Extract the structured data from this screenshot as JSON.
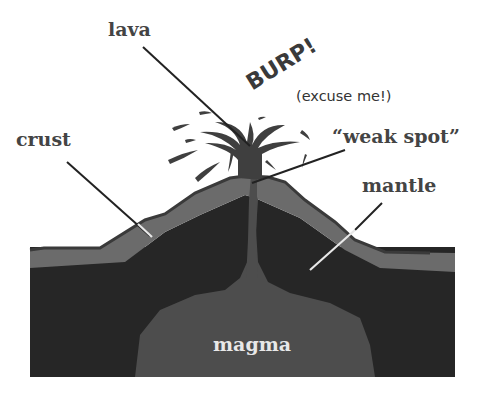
{
  "diagram": {
    "labels": {
      "lava": "lava",
      "burp": "BURP!",
      "excuse": "(excuse me!)",
      "crust": "crust",
      "weak_spot": "“weak spot”",
      "mantle": "mantle",
      "magma": "magma"
    },
    "colors": {
      "crust": "#6b6b6b",
      "mantle": "#262626",
      "magma": "#4d4d4d",
      "lava": "#3f3f3f",
      "outline": "#3a3a3a",
      "background": "#ffffff"
    }
  }
}
